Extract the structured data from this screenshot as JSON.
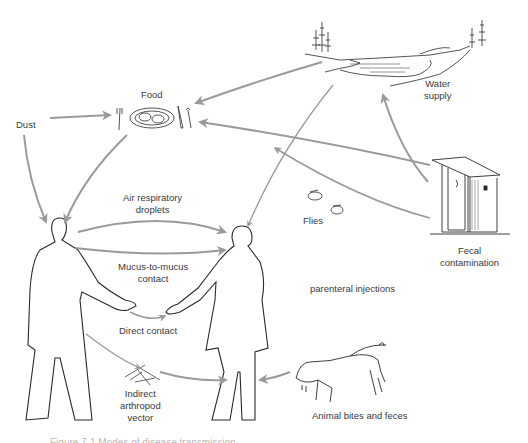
{
  "diagram": {
    "type": "disease-transmission-routes",
    "colors": {
      "arrow": "#9a9a9a",
      "outline": "#2a2a2a",
      "text": "#3a3a3a"
    },
    "nodes": {
      "dust": "Dust",
      "food": "Food",
      "water": [
        "Water",
        "supply"
      ],
      "flies": "Flies",
      "fecal": [
        "Fecal",
        "contamination"
      ],
      "air": [
        "Air respiratory",
        "droplets"
      ],
      "mucus": [
        "Mucus-to-mucus",
        "contact"
      ],
      "direct": "Direct contact",
      "parenteral": "parenteral injections",
      "arthropod": [
        "Indirect",
        "arthropod",
        "vector"
      ],
      "animal": "Animal bites and feces"
    },
    "caption": "Figure 7-1 Modes of disease transmission."
  }
}
